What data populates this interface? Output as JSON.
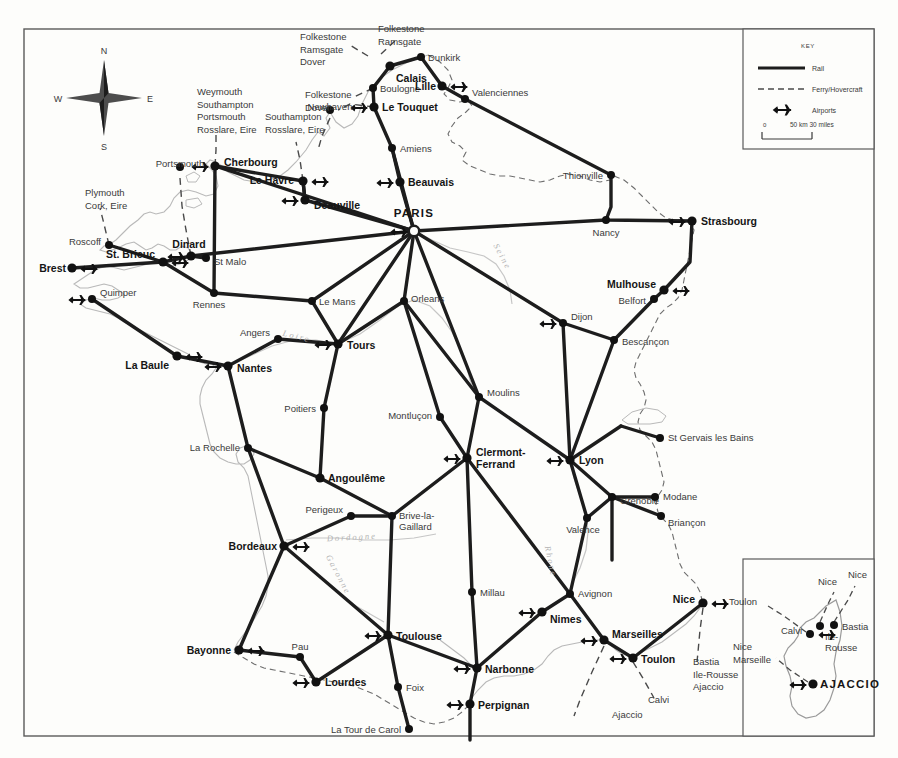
{
  "map": {
    "title": "Rail and Ferry Map of France",
    "compass": {
      "n": "N",
      "e": "E",
      "s": "S",
      "w": "W"
    },
    "key": {
      "title": "KEY",
      "rail_label": "Rail",
      "ferry_label": "Ferry/Hovercraft",
      "airports_label": "Airports",
      "scale_zero": "0",
      "scale_text": "50 km 30 miles"
    },
    "colors": {
      "rail": "#1d1d1d",
      "ferry": "#4a4a4a",
      "coast": "#b9b9b9",
      "border": "#6e6e6e",
      "river": "#c6c6c6",
      "node": "#111111",
      "paper": "#fdfdfb"
    },
    "cities": [
      {
        "name": "PARIS",
        "x": 414,
        "y": 231,
        "style": "capital",
        "label_dx": 0,
        "label_dy": -14,
        "anchor": "middle",
        "airport": true
      },
      {
        "name": "Calais",
        "x": 390,
        "y": 66,
        "style": "bold",
        "label_dx": 6,
        "label_dy": 16,
        "anchor": "start",
        "airport": false
      },
      {
        "name": "Dunkirk",
        "x": 421,
        "y": 57,
        "style": "plain",
        "label_dx": 7,
        "label_dy": 4,
        "anchor": "start",
        "airport": false
      },
      {
        "name": "Boulogne",
        "x": 373,
        "y": 88,
        "style": "plain",
        "label_dx": 7,
        "label_dy": 4,
        "anchor": "start",
        "airport": false
      },
      {
        "name": "Lille",
        "x": 442,
        "y": 86,
        "style": "bold",
        "label_dx": -6,
        "label_dy": 4,
        "anchor": "end",
        "airport": true
      },
      {
        "name": "Valenciennes",
        "x": 465,
        "y": 99,
        "style": "plain",
        "label_dx": 7,
        "label_dy": -3,
        "anchor": "start",
        "airport": false
      },
      {
        "name": "Le Touquet",
        "x": 374,
        "y": 107,
        "style": "bold",
        "label_dx": 8,
        "label_dy": 4,
        "anchor": "start",
        "airport": true
      },
      {
        "name": "Amiens",
        "x": 392,
        "y": 148,
        "style": "plain",
        "label_dx": 8,
        "label_dy": 4,
        "anchor": "start",
        "airport": false
      },
      {
        "name": "Beauvais",
        "x": 400,
        "y": 182,
        "style": "bold",
        "label_dx": 8,
        "label_dy": 4,
        "anchor": "start",
        "airport": true
      },
      {
        "name": "Thionville",
        "x": 611,
        "y": 175,
        "style": "plain",
        "label_dx": -8,
        "label_dy": 4,
        "anchor": "end",
        "airport": false
      },
      {
        "name": "Nancy",
        "x": 606,
        "y": 220,
        "style": "plain",
        "label_dx": 0,
        "label_dy": 16,
        "anchor": "middle",
        "airport": false
      },
      {
        "name": "Strasbourg",
        "x": 692,
        "y": 221,
        "style": "bold",
        "label_dx": 9,
        "label_dy": 4,
        "anchor": "start",
        "airport": true
      },
      {
        "name": "Mulhouse",
        "x": 664,
        "y": 290,
        "style": "bold",
        "label_dx": -8,
        "label_dy": -2,
        "anchor": "end",
        "airport": true
      },
      {
        "name": "Belfort",
        "x": 654,
        "y": 299,
        "style": "plain",
        "label_dx": -8,
        "label_dy": 5,
        "anchor": "end",
        "airport": false
      },
      {
        "name": "Bescançon",
        "x": 614,
        "y": 340,
        "style": "plain",
        "label_dx": 8,
        "label_dy": 5,
        "anchor": "start",
        "airport": false
      },
      {
        "name": "Dijon",
        "x": 563,
        "y": 323,
        "style": "plain",
        "label_dx": 8,
        "label_dy": -3,
        "anchor": "start",
        "airport": true
      },
      {
        "name": "Cherbourg",
        "x": 215,
        "y": 166,
        "style": "bold",
        "label_dx": 9,
        "label_dy": 0,
        "anchor": "start",
        "airport": true
      },
      {
        "name": "Le Havre",
        "x": 303,
        "y": 181,
        "style": "bold",
        "label_dx": -9,
        "label_dy": 3,
        "anchor": "end",
        "airport": true
      },
      {
        "name": "Deauville",
        "x": 305,
        "y": 200,
        "style": "bold",
        "label_dx": 9,
        "label_dy": 9,
        "anchor": "start",
        "airport": true
      },
      {
        "name": "Newhaven",
        "x": 330,
        "y": 110,
        "style": "plain",
        "label_dx": 0,
        "label_dy": 0,
        "anchor": "middle",
        "airport": false
      },
      {
        "name": "Portsmouth",
        "x": 180,
        "y": 167,
        "style": "plain",
        "label_dx": 0,
        "label_dy": 0,
        "anchor": "middle",
        "airport": false
      },
      {
        "name": "Roscoff",
        "x": 109,
        "y": 245,
        "style": "plain",
        "label_dx": -8,
        "label_dy": 0,
        "anchor": "end",
        "airport": false
      },
      {
        "name": "Brest",
        "x": 72,
        "y": 268,
        "style": "bold",
        "label_dx": -6,
        "label_dy": 4,
        "anchor": "end",
        "airport": true
      },
      {
        "name": "St. Brieuc",
        "x": 163,
        "y": 262,
        "style": "bold",
        "label_dx": -8,
        "label_dy": -4,
        "anchor": "end",
        "airport": true
      },
      {
        "name": "Dinard",
        "x": 191,
        "y": 256,
        "style": "bold",
        "label_dx": -2,
        "label_dy": -8,
        "anchor": "middle",
        "airport": true
      },
      {
        "name": "St Malo",
        "x": 206,
        "y": 258,
        "style": "plain",
        "label_dx": 8,
        "label_dy": 7,
        "anchor": "start",
        "airport": false
      },
      {
        "name": "Quimper",
        "x": 92,
        "y": 299,
        "style": "plain",
        "label_dx": 8,
        "label_dy": -3,
        "anchor": "start",
        "airport": true
      },
      {
        "name": "Rennes",
        "x": 214,
        "y": 293,
        "style": "plain",
        "label_dx": -5,
        "label_dy": 15,
        "anchor": "middle",
        "airport": false
      },
      {
        "name": "La Baule",
        "x": 177,
        "y": 356,
        "style": "bold",
        "label_dx": -8,
        "label_dy": 13,
        "anchor": "end",
        "airport": true
      },
      {
        "name": "Nantes",
        "x": 228,
        "y": 366,
        "style": "bold",
        "label_dx": 9,
        "label_dy": 6,
        "anchor": "start",
        "airport": true
      },
      {
        "name": "Angers",
        "x": 278,
        "y": 339,
        "style": "plain",
        "label_dx": -8,
        "label_dy": -3,
        "anchor": "end",
        "airport": false
      },
      {
        "name": "Le Mans",
        "x": 312,
        "y": 301,
        "style": "plain",
        "label_dx": 7,
        "label_dy": 4,
        "anchor": "start",
        "airport": false
      },
      {
        "name": "Tours",
        "x": 338,
        "y": 344,
        "style": "bold",
        "label_dx": 9,
        "label_dy": 5,
        "anchor": "start",
        "airport": true
      },
      {
        "name": "Orleans",
        "x": 404,
        "y": 301,
        "style": "plain",
        "label_dx": 7,
        "label_dy": 1,
        "anchor": "start",
        "airport": false
      },
      {
        "name": "Poitiers",
        "x": 324,
        "y": 408,
        "style": "plain",
        "label_dx": -8,
        "label_dy": 4,
        "anchor": "end",
        "airport": false
      },
      {
        "name": "Montluçon",
        "x": 440,
        "y": 417,
        "style": "plain",
        "label_dx": -8,
        "label_dy": 2,
        "anchor": "end",
        "airport": false
      },
      {
        "name": "Moulins",
        "x": 479,
        "y": 397,
        "style": "plain",
        "label_dx": 8,
        "label_dy": -1,
        "anchor": "start",
        "airport": false
      },
      {
        "name": "La Rochelle",
        "x": 248,
        "y": 448,
        "style": "plain",
        "label_dx": -8,
        "label_dy": 3,
        "anchor": "end",
        "airport": false
      },
      {
        "name": "Angoulême",
        "x": 320,
        "y": 478,
        "style": "bold",
        "label_dx": 8,
        "label_dy": 4,
        "anchor": "start",
        "airport": false
      },
      {
        "name": "Perigeux",
        "x": 351,
        "y": 516,
        "style": "plain",
        "label_dx": -8,
        "label_dy": -3,
        "anchor": "end",
        "airport": false
      },
      {
        "name": "Brive-la-Gaillard",
        "x": 392,
        "y": 516,
        "style": "plain",
        "label_dx": 7,
        "label_dy": 3,
        "anchor": "start",
        "airport": false
      },
      {
        "name": "Bordeaux",
        "x": 284,
        "y": 546,
        "style": "bold",
        "label_dx": -7,
        "label_dy": 4,
        "anchor": "end",
        "airport": true
      },
      {
        "name": "Clermont-Ferrand",
        "x": 467,
        "y": 458,
        "style": "bold",
        "label_dx": 9,
        "label_dy": -2,
        "anchor": "start",
        "airport": true
      },
      {
        "name": "Lyon",
        "x": 570,
        "y": 460,
        "style": "bold",
        "label_dx": 9,
        "label_dy": 4,
        "anchor": "start",
        "airport": true
      },
      {
        "name": "Grenoble",
        "x": 612,
        "y": 497,
        "style": "plain",
        "label_dx": 8,
        "label_dy": 7,
        "anchor": "start",
        "airport": false
      },
      {
        "name": "Modane",
        "x": 655,
        "y": 497,
        "style": "plain",
        "label_dx": 8,
        "label_dy": 3,
        "anchor": "start",
        "airport": false
      },
      {
        "name": "Briançon",
        "x": 661,
        "y": 516,
        "style": "plain",
        "label_dx": 7,
        "label_dy": 10,
        "anchor": "start",
        "airport": false
      },
      {
        "name": "St Gervais les Bains",
        "x": 660,
        "y": 438,
        "style": "plain",
        "label_dx": 8,
        "label_dy": 3,
        "anchor": "start",
        "airport": false
      },
      {
        "name": "Valence",
        "x": 587,
        "y": 518,
        "style": "plain",
        "label_dx": -4,
        "label_dy": 15,
        "anchor": "middle",
        "airport": false
      },
      {
        "name": "Millau",
        "x": 472,
        "y": 592,
        "style": "plain",
        "label_dx": 8,
        "label_dy": 4,
        "anchor": "start",
        "airport": false
      },
      {
        "name": "Avignon",
        "x": 570,
        "y": 594,
        "style": "plain",
        "label_dx": 8,
        "label_dy": 3,
        "anchor": "start",
        "airport": false
      },
      {
        "name": "Nimes",
        "x": 542,
        "y": 612,
        "style": "bold",
        "label_dx": 8,
        "label_dy": 11,
        "anchor": "start",
        "airport": true
      },
      {
        "name": "Marseilles",
        "x": 604,
        "y": 640,
        "style": "bold",
        "label_dx": 8,
        "label_dy": -2,
        "anchor": "start",
        "airport": true
      },
      {
        "name": "Toulon",
        "x": 633,
        "y": 658,
        "style": "bold",
        "label_dx": 8,
        "label_dy": 5,
        "anchor": "start",
        "airport": true
      },
      {
        "name": "Nice",
        "x": 703,
        "y": 603,
        "style": "bold",
        "label_dx": -8,
        "label_dy": 0,
        "anchor": "end",
        "airport": true
      },
      {
        "name": "Narbonne",
        "x": 477,
        "y": 668,
        "style": "bold",
        "label_dx": 8,
        "label_dy": 5,
        "anchor": "start",
        "airport": true
      },
      {
        "name": "Perpignan",
        "x": 470,
        "y": 704,
        "style": "bold",
        "label_dx": 8,
        "label_dy": 5,
        "anchor": "start",
        "airport": true
      },
      {
        "name": "Toulouse",
        "x": 388,
        "y": 635,
        "style": "bold",
        "label_dx": 8,
        "label_dy": 5,
        "anchor": "start",
        "airport": true
      },
      {
        "name": "Foix",
        "x": 398,
        "y": 687,
        "style": "plain",
        "label_dx": 8,
        "label_dy": 4,
        "anchor": "start",
        "airport": false
      },
      {
        "name": "La Tour de Carol",
        "x": 409,
        "y": 729,
        "style": "plain",
        "label_dx": -8,
        "label_dy": 4,
        "anchor": "end",
        "airport": false
      },
      {
        "name": "Bayonne",
        "x": 239,
        "y": 650,
        "style": "bold",
        "label_dx": -8,
        "label_dy": 4,
        "anchor": "end",
        "airport": true
      },
      {
        "name": "Pau",
        "x": 300,
        "y": 657,
        "style": "plain",
        "label_dx": 0,
        "label_dy": -7,
        "anchor": "middle",
        "airport": false
      },
      {
        "name": "Lourdes",
        "x": 316,
        "y": 682,
        "style": "bold",
        "label_dx": 9,
        "label_dy": 4,
        "anchor": "start",
        "airport": true
      }
    ],
    "ferry_destinations": [
      {
        "lines": [
          "Folkestone",
          "Ramsgate",
          "Dover"
        ],
        "x": 300,
        "y": 40,
        "anchor": "start"
      },
      {
        "lines": [
          "Folkestone",
          "Ramsgate"
        ],
        "x": 378,
        "y": 32,
        "anchor": "start"
      },
      {
        "lines": [
          "Folkestone",
          "Dover"
        ],
        "x": 305,
        "y": 98,
        "anchor": "start"
      },
      {
        "lines": [
          "Weymouth",
          "Southampton",
          "Portsmouth",
          "Rosslare, Eire"
        ],
        "x": 197,
        "y": 95,
        "anchor": "start"
      },
      {
        "lines": [
          "Southampton",
          "Rosslare, Eire"
        ],
        "x": 265,
        "y": 120,
        "anchor": "start"
      },
      {
        "lines": [
          "Plymouth",
          "Cork, Eire"
        ],
        "x": 85,
        "y": 196,
        "anchor": "start"
      },
      {
        "lines": [
          "Bastia",
          "Ile-Rousse",
          "Ajaccio"
        ],
        "x": 693,
        "y": 665,
        "anchor": "start"
      },
      {
        "lines": [
          "Calvi"
        ],
        "x": 648,
        "y": 703,
        "anchor": "start"
      },
      {
        "lines": [
          "Ajaccio"
        ],
        "x": 612,
        "y": 718,
        "anchor": "start"
      }
    ],
    "rivers": [
      {
        "name": "Seine",
        "x": 500,
        "y": 258,
        "rotate": 62
      },
      {
        "name": "Loire",
        "x": 296,
        "y": 339,
        "rotate": 14
      },
      {
        "name": "Dordogne",
        "x": 352,
        "y": 540,
        "rotate": -3
      },
      {
        "name": "Garonne",
        "x": 336,
        "y": 576,
        "rotate": 62
      },
      {
        "name": "Rhone",
        "x": 548,
        "y": 562,
        "rotate": 78
      }
    ]
  },
  "corsica": {
    "title": "Corsica inset",
    "cities": [
      {
        "name": "Bastia",
        "x": 834,
        "y": 625,
        "style": "plain",
        "label_dx": 8,
        "label_dy": 5,
        "anchor": "start",
        "airport": false
      },
      {
        "name": "Ile Rousse",
        "x": 820,
        "y": 626,
        "style": "plain",
        "label_dx": 5,
        "label_dy": 14,
        "anchor": "start",
        "airport": false
      },
      {
        "name": "Calvi",
        "x": 810,
        "y": 634,
        "style": "plain",
        "label_dx": -8,
        "label_dy": 0,
        "anchor": "end",
        "airport": true
      },
      {
        "name": "AJACCIO",
        "x": 813,
        "y": 684,
        "style": "capital-solid",
        "label_dx": 7,
        "label_dy": 4,
        "anchor": "start",
        "airport": true
      }
    ],
    "ferry_destinations": [
      {
        "lines": [
          "Nice"
        ],
        "x": 818,
        "y": 585,
        "anchor": "start"
      },
      {
        "lines": [
          "Nice"
        ],
        "x": 848,
        "y": 578,
        "anchor": "start"
      },
      {
        "lines": [
          "Toulon"
        ],
        "x": 729,
        "y": 605,
        "anchor": "start"
      },
      {
        "lines": [
          "Nice",
          "Marseille"
        ],
        "x": 733,
        "y": 650,
        "anchor": "start"
      }
    ]
  }
}
